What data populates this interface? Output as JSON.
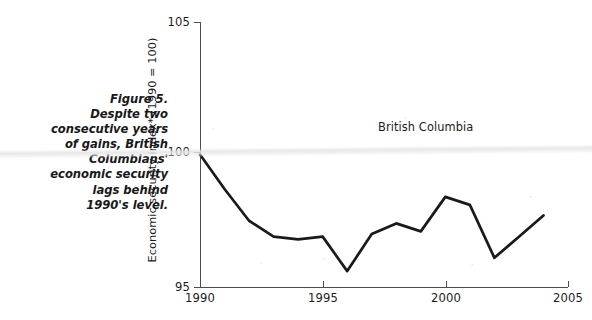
{
  "figure": {
    "caption_lines": [
      "Figure 5.",
      "Despite two",
      "consecutive years",
      "of gains, British",
      "Columbians'",
      "economic security",
      "lags behind",
      "1990's level."
    ],
    "caption_text": "Figure 5. Despite two consecutive years of gains, British Columbians' economic security lags behind 1990's level."
  },
  "chart_data": {
    "type": "line",
    "title": "",
    "subtitle": "",
    "xlabel": "",
    "ylabel": "Economic security index* (1990 = 100)",
    "xlim": [
      1990,
      2005
    ],
    "ylim": [
      95,
      105
    ],
    "xticks": [
      1990,
      1995,
      2000,
      2005
    ],
    "xtick_labels": [
      "1990",
      "1995",
      "2000",
      "2005"
    ],
    "yticks": [
      95,
      100,
      105
    ],
    "ytick_labels": [
      "95",
      "100",
      "105"
    ],
    "grid": false,
    "legend": "inline-annotation",
    "annotations": [
      {
        "text": "British Columbia",
        "x": 1999.2,
        "y": 101.0
      }
    ],
    "series": [
      {
        "name": "British Columbia",
        "color": "#1a1a1a",
        "x": [
          1990,
          1991,
          1992,
          1993,
          1994,
          1995,
          1996,
          1997,
          1998,
          1999,
          2000,
          2001,
          2002,
          2003,
          2004
        ],
        "values": [
          100.0,
          98.7,
          97.5,
          96.9,
          96.8,
          96.9,
          95.6,
          97.0,
          97.4,
          97.1,
          98.4,
          98.1,
          96.1,
          96.9,
          97.7
        ]
      }
    ]
  },
  "axis_note": "*",
  "colors": {
    "line": "#1a1a1a",
    "axis": "#4c4c4c",
    "text": "#1b1b1b"
  }
}
